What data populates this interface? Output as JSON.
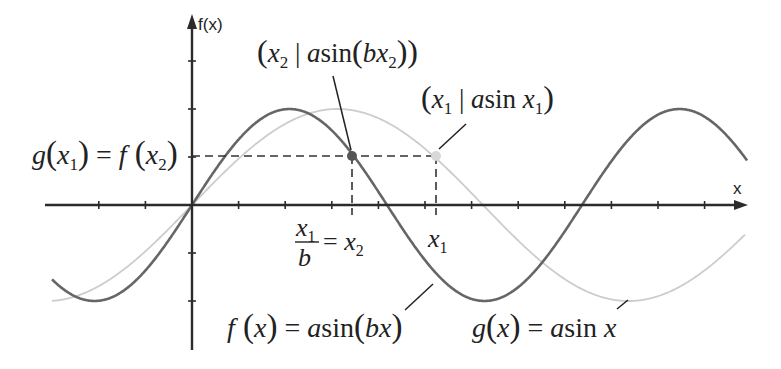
{
  "diagram": {
    "axes": {
      "x_label": "x",
      "y_label": "f(x)",
      "origin_px": [
        192,
        205
      ],
      "x_tick_spacing_px": 46.6,
      "x_ticks_left": 2,
      "x_ticks_right": 11,
      "y_tick_spacing_px": 48,
      "y_ticks_up": 3,
      "y_ticks_down": 2,
      "x_axis_range_px": [
        45,
        748
      ],
      "y_axis_range_px": [
        14,
        350
      ],
      "color": "#2b2b2b"
    },
    "curves": [
      {
        "name": "f",
        "label_text": "f(x) = a sin(bx)",
        "amplitude_px": 96,
        "period_px": 390,
        "x_range_px": [
          52,
          747
        ],
        "color": "#666666",
        "width": 2.6
      },
      {
        "name": "g",
        "label_text": "g(x) = a sin x",
        "amplitude_px": 96,
        "period_px": 582,
        "x_range_px": [
          52,
          745
        ],
        "color": "#cccccc",
        "width": 1.8
      }
    ],
    "points": [
      {
        "name": "f-point",
        "label_text": "(x₂ | a sin(bx₂))",
        "px": [
          352,
          156
        ],
        "color": "#555555"
      },
      {
        "name": "g-point",
        "label_text": "(x₁ | a sin x₁)",
        "px": [
          436,
          156
        ],
        "color": "#d5d5d5"
      }
    ],
    "annotations": {
      "level_label": "g(x₁) = f(x₂)",
      "x2_label": "x₁/b = x₂",
      "x1_label": "x₁",
      "dash_color": "#333333"
    }
  }
}
